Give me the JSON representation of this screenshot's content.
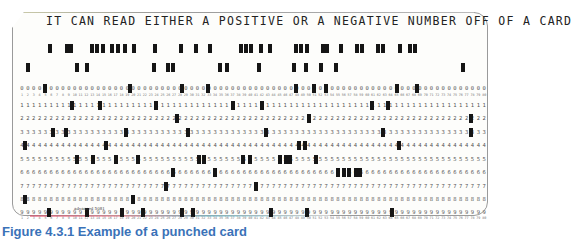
{
  "card": {
    "title": "IT CAN READ EITHER A POSITIVE OR A NEGATIVE NUMBER OFF OF A CARD",
    "columns": 80,
    "first_column_x": 22,
    "column_pitch": 5.85,
    "imprint": "advanced 5081",
    "rows": [
      {
        "label": "12",
        "y": 44,
        "printed": false,
        "punch_x": [
          50,
          67,
          71,
          92,
          97,
          103,
          112,
          118,
          125,
          134,
          155,
          181,
          196,
          210,
          241,
          246,
          251,
          261,
          270,
          296,
          301,
          307,
          323,
          327,
          341,
          357,
          362,
          378,
          383,
          400,
          410,
          415
        ]
      },
      {
        "label": "11",
        "y": 63,
        "printed": false,
        "punch_x": [
          28,
          77,
          87,
          154,
          168,
          173,
          220,
          227,
          259,
          294,
          306,
          321,
          336,
          463
        ]
      },
      {
        "label": "0",
        "y": 84,
        "printed": true,
        "digit": "0",
        "punch_x": [
          45,
          130,
          182,
          208,
          296,
          314,
          326,
          397,
          417
        ]
      },
      {
        "label": "1",
        "y": 101,
        "printed": true,
        "digit": "1",
        "punch_x": [
          72,
          100,
          156,
          233,
          262,
          372,
          388
        ]
      },
      {
        "label": "2",
        "y": 114,
        "printed": true,
        "digit": "2",
        "punch_x": [
          177,
          309,
          471
        ]
      },
      {
        "label": "3",
        "y": 128,
        "printed": true,
        "digit": "3",
        "punch_x": [
          53,
          66,
          126,
          188,
          266,
          383,
          471
        ]
      },
      {
        "label": "4",
        "y": 141,
        "printed": true,
        "digit": "4",
        "punch_x": [
          25,
          106,
          299,
          305,
          399
        ]
      },
      {
        "label": "5",
        "y": 155,
        "printed": true,
        "digit": "5",
        "punch_x": [
          77,
          93,
          116,
          138,
          199,
          204,
          243,
          250,
          280,
          286,
          290,
          316
        ]
      },
      {
        "label": "6",
        "y": 168,
        "printed": true,
        "digit": "6",
        "punch_x": [
          173,
          215,
          338,
          344,
          349,
          356,
          360
        ]
      },
      {
        "label": "7",
        "y": 182,
        "printed": true,
        "digit": "7",
        "punch_x": [
          166,
          256
        ]
      },
      {
        "label": "8",
        "y": 195,
        "printed": true,
        "digit": "8",
        "punch_x": [
          25,
          133
        ]
      },
      {
        "label": "9",
        "y": 208,
        "printed": true,
        "digit": "9",
        "punch_x": [
          49,
          87,
          122,
          143,
          182,
          193,
          271,
          307,
          392
        ]
      }
    ],
    "column_number_rows_y": [
      93,
      216
    ]
  },
  "caption": "Figure 4.3.1  Example of a punched card"
}
